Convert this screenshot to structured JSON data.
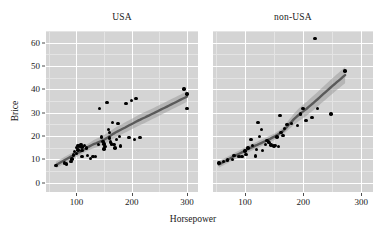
{
  "chart_data": {
    "type": "scatter",
    "title": "",
    "xlabel": "Horsepower",
    "ylabel": "Brice",
    "xlim": [
      45,
      320
    ],
    "ylim": [
      -4,
      65
    ],
    "xticks": [
      100,
      200,
      300
    ],
    "xticklabels": [
      "100",
      "200",
      "300"
    ],
    "yticks": [
      0,
      10,
      20,
      30,
      40,
      50,
      60
    ],
    "yticklabels": [
      "0",
      "10",
      "20",
      "30",
      "40",
      "50",
      "60"
    ],
    "grid": true,
    "legend": "none",
    "panel_background": "#d4d4d4",
    "gridline_color": "#ffffff",
    "point_color": "#000000",
    "smooth_line_color": "#5a5a5a",
    "smooth_band_color": "#9a9a9a",
    "facet_variable": "Origin",
    "facets": [
      {
        "label": "USA",
        "points": [
          [
            63,
            7.4
          ],
          [
            78,
            8.4
          ],
          [
            82,
            8.0
          ],
          [
            90,
            9.2
          ],
          [
            92,
            10.1
          ],
          [
            95,
            11.8
          ],
          [
            96,
            13.4
          ],
          [
            100,
            12.5
          ],
          [
            100,
            15.1
          ],
          [
            102,
            15.9
          ],
          [
            103,
            14.0
          ],
          [
            105,
            15.7
          ],
          [
            108,
            16.3
          ],
          [
            110,
            15.3
          ],
          [
            110,
            13.9
          ],
          [
            110,
            11.1
          ],
          [
            115,
            16.0
          ],
          [
            118,
            14.9
          ],
          [
            120,
            11.6
          ],
          [
            125,
            10.3
          ],
          [
            130,
            11.3
          ],
          [
            135,
            11.1
          ],
          [
            140,
            16.3
          ],
          [
            142,
            31.9
          ],
          [
            145,
            19.5
          ],
          [
            148,
            17.7
          ],
          [
            150,
            14.4
          ],
          [
            150,
            16.5
          ],
          [
            152,
            15.6
          ],
          [
            155,
            34.3
          ],
          [
            158,
            22.7
          ],
          [
            160,
            21.5
          ],
          [
            160,
            19.1
          ],
          [
            162,
            17.5
          ],
          [
            163,
            16.6
          ],
          [
            165,
            25.8
          ],
          [
            168,
            16.3
          ],
          [
            170,
            14.9
          ],
          [
            172,
            18.4
          ],
          [
            175,
            25.3
          ],
          [
            178,
            19.8
          ],
          [
            180,
            15.7
          ],
          [
            190,
            33.9
          ],
          [
            195,
            19.3
          ],
          [
            200,
            35.2
          ],
          [
            205,
            18.5
          ],
          [
            208,
            36.1
          ],
          [
            215,
            19.3
          ],
          [
            295,
            40.1
          ],
          [
            300,
            38.0
          ],
          [
            300,
            31.9
          ]
        ]
      },
      {
        "label": "non-USA",
        "points": [
          [
            55,
            8.4
          ],
          [
            63,
            9.1
          ],
          [
            70,
            9.8
          ],
          [
            78,
            10.0
          ],
          [
            81,
            11.6
          ],
          [
            90,
            11.1
          ],
          [
            95,
            11.3
          ],
          [
            100,
            13.5
          ],
          [
            102,
            12.2
          ],
          [
            105,
            14.9
          ],
          [
            110,
            18.5
          ],
          [
            113,
            15.9
          ],
          [
            118,
            11.5
          ],
          [
            120,
            14.1
          ],
          [
            122,
            25.8
          ],
          [
            125,
            19.8
          ],
          [
            128,
            22.7
          ],
          [
            130,
            13.9
          ],
          [
            135,
            16.3
          ],
          [
            138,
            18.0
          ],
          [
            140,
            17.5
          ],
          [
            142,
            17.2
          ],
          [
            145,
            16.1
          ],
          [
            150,
            15.7
          ],
          [
            152,
            15.9
          ],
          [
            155,
            19.5
          ],
          [
            158,
            15.6
          ],
          [
            160,
            28.7
          ],
          [
            162,
            21.5
          ],
          [
            165,
            20.2
          ],
          [
            168,
            23.3
          ],
          [
            172,
            25.0
          ],
          [
            180,
            25.3
          ],
          [
            190,
            24.4
          ],
          [
            195,
            29.5
          ],
          [
            200,
            31.9
          ],
          [
            205,
            26.7
          ],
          [
            215,
            28.0
          ],
          [
            220,
            61.9
          ],
          [
            225,
            31.9
          ],
          [
            248,
            29.5
          ],
          [
            272,
            47.9
          ]
        ]
      }
    ]
  }
}
